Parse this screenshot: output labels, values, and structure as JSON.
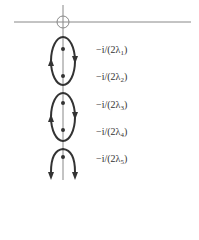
{
  "diagram": {
    "colors": {
      "stroke": "#333333",
      "axis": "#777777",
      "background": "#ffffff"
    },
    "poles": [
      {
        "label_prefix": "−i/(2λ",
        "sub": "1",
        "label_suffix": ")"
      },
      {
        "label_prefix": "−i/(2λ",
        "sub": "2",
        "label_suffix": ")"
      },
      {
        "label_prefix": "−i/(2λ",
        "sub": "3",
        "label_suffix": ")"
      },
      {
        "label_prefix": "−i/(2λ",
        "sub": "4",
        "label_suffix": ")"
      },
      {
        "label_prefix": "−i/(2λ",
        "sub": "5",
        "label_suffix": ")"
      }
    ]
  }
}
